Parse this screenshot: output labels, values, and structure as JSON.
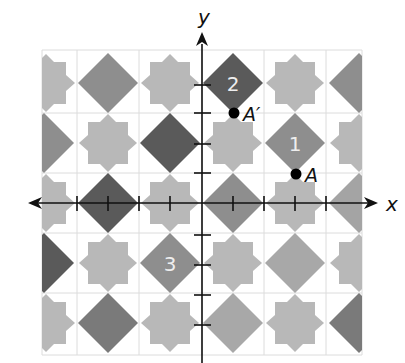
{
  "figure": {
    "axes": {
      "x_label": "x",
      "y_label": "y",
      "unit_px": 31,
      "origin_px": [
        202,
        203
      ]
    },
    "tile_labels": [
      {
        "id": "1",
        "text": "1"
      },
      {
        "id": "2",
        "text": "2"
      },
      {
        "id": "3",
        "text": "3"
      }
    ],
    "points": [
      {
        "label": "A",
        "coords": [
          3,
          1
        ]
      },
      {
        "label": "A′",
        "coords": [
          1,
          3
        ]
      }
    ],
    "colors": {
      "star": "#b8b8b8",
      "diamond_medium": "#8e8e8e",
      "diamond_dark": "#5a5a5a",
      "grid_line": "#dcdcdc",
      "axis": "#111111",
      "label_on_tile": "#eeeeee"
    }
  }
}
